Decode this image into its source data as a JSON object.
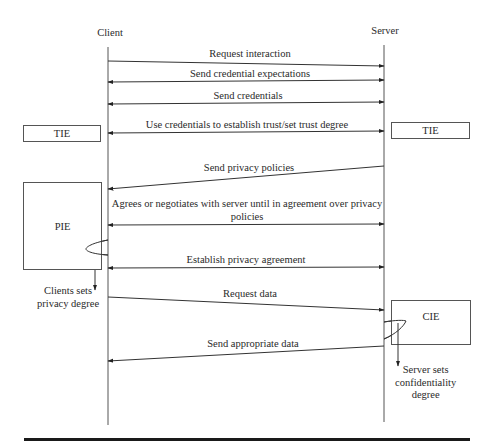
{
  "diagram": {
    "type": "sequence",
    "participants": {
      "client": {
        "label": "Client"
      },
      "server": {
        "label": "Server"
      }
    },
    "messages": [
      {
        "label": "Request interaction",
        "direction": "client-to-server"
      },
      {
        "label": "Send credential expectations",
        "direction": "bidirectional"
      },
      {
        "label": "Send credentials",
        "direction": "bidirectional"
      },
      {
        "label": "Use credentials to establish trust/set trust degree",
        "direction": "bidirectional"
      },
      {
        "label": "Send privacy policies",
        "direction": "server-to-client"
      },
      {
        "label_line1": "Agrees or negotiates with server until in agreement over privacy",
        "label_line2": "policies",
        "direction": "bidirectional"
      },
      {
        "label": "Establish privacy agreement",
        "direction": "bidirectional"
      },
      {
        "label": "Request data",
        "direction": "client-to-server"
      },
      {
        "label": "Send appropriate data",
        "direction": "server-to-client"
      }
    ],
    "boxes": {
      "tie_left": {
        "label": "TIE"
      },
      "tie_right": {
        "label": "TIE"
      },
      "pie": {
        "label": "PIE"
      },
      "cie": {
        "label": "CIE"
      }
    },
    "notes": {
      "client_note": {
        "line1": "Clients sets",
        "line2": "privacy degree"
      },
      "server_note": {
        "line1": "Server sets",
        "line2": "confidentiality",
        "line3": "degree"
      }
    },
    "colors": {
      "line": "#333333",
      "text": "#2a2a2a",
      "rule": "#1a1a1a"
    }
  }
}
